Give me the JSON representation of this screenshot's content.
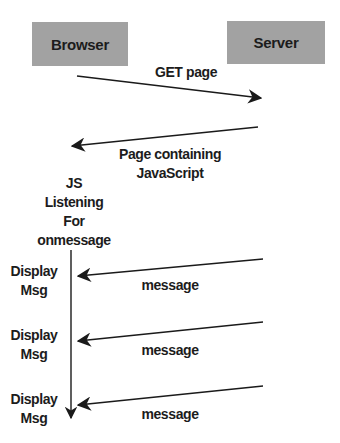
{
  "diagram": {
    "type": "sequence",
    "actors": [
      {
        "id": "browser",
        "label": "Browser"
      },
      {
        "id": "server",
        "label": "Server"
      }
    ],
    "requests": {
      "get_page": "GET page",
      "page_response_line1": "Page containing",
      "page_response_line2": "JavaScript"
    },
    "listener": {
      "line1": "JS",
      "line2": "Listening",
      "line3": "For",
      "line4": "onmessage"
    },
    "messages": [
      {
        "label": "message",
        "action_line1": "Display",
        "action_line2": "Msg"
      },
      {
        "label": "message",
        "action_line1": "Display",
        "action_line2": "Msg"
      },
      {
        "label": "message",
        "action_line1": "Display",
        "action_line2": "Msg"
      }
    ],
    "colors": {
      "actor_box_fill": "#a2a2a2",
      "line": "#1a1a1a",
      "background": "#ffffff"
    }
  }
}
